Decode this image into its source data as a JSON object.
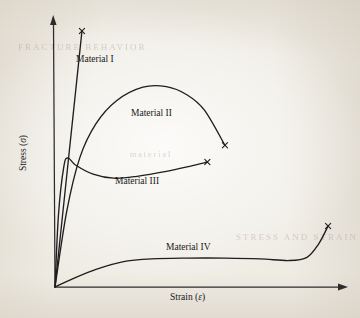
{
  "figure": {
    "background_color": "#efece4",
    "ink_color": "#1e1e1e"
  },
  "chart_data": {
    "type": "line",
    "title": "",
    "xlabel": "Strain (ε)",
    "ylabel": "Stress (σ)",
    "grid": false,
    "legend_position": "inline-annotations",
    "axis_style": "arrow-headed, unlabeled qualitative axes",
    "xlim": [
      0,
      1
    ],
    "ylim": [
      0,
      1
    ],
    "axis_ticks": {
      "x": [],
      "y": []
    },
    "fracture_marker": "x",
    "series": [
      {
        "name": "Material I",
        "label": "Material I",
        "description": "Stiff brittle material: very steep linear elastic response, fractures at high stress with negligible plastic strain.",
        "fracture_point": {
          "x": 0.092,
          "y": 0.948
        },
        "points": [
          {
            "x": 0.0,
            "y": 0.0
          },
          {
            "x": 0.023,
            "y": 0.237
          },
          {
            "x": 0.046,
            "y": 0.474
          },
          {
            "x": 0.069,
            "y": 0.711
          },
          {
            "x": 0.092,
            "y": 0.948
          }
        ]
      },
      {
        "name": "Material II",
        "label": "Material II",
        "description": "Strong ductile material: steep elastic rise, broad work-hardening arch to a high peak stress, then gradual decline to fracture.",
        "fracture_point": {
          "x": 0.58,
          "y": 0.525
        },
        "points": [
          {
            "x": 0.0,
            "y": 0.0
          },
          {
            "x": 0.04,
            "y": 0.28
          },
          {
            "x": 0.085,
            "y": 0.48
          },
          {
            "x": 0.14,
            "y": 0.605
          },
          {
            "x": 0.21,
            "y": 0.69
          },
          {
            "x": 0.3,
            "y": 0.74
          },
          {
            "x": 0.38,
            "y": 0.742
          },
          {
            "x": 0.45,
            "y": 0.712
          },
          {
            "x": 0.51,
            "y": 0.655
          },
          {
            "x": 0.58,
            "y": 0.525
          }
        ]
      },
      {
        "name": "Material III",
        "label": "Material III",
        "description": "Material with a sharp upper yield point followed by a lower yield plateau, then mild strain hardening to fracture.",
        "fracture_point": {
          "x": 0.52,
          "y": 0.463
        },
        "points": [
          {
            "x": 0.0,
            "y": 0.0
          },
          {
            "x": 0.012,
            "y": 0.27
          },
          {
            "x": 0.03,
            "y": 0.445
          },
          {
            "x": 0.044,
            "y": 0.478
          },
          {
            "x": 0.07,
            "y": 0.452
          },
          {
            "x": 0.13,
            "y": 0.418
          },
          {
            "x": 0.2,
            "y": 0.403
          },
          {
            "x": 0.28,
            "y": 0.41
          },
          {
            "x": 0.38,
            "y": 0.428
          },
          {
            "x": 0.46,
            "y": 0.447
          },
          {
            "x": 0.52,
            "y": 0.463
          }
        ]
      },
      {
        "name": "Material IV",
        "label": "Material IV",
        "description": "Soft elastomeric material: low modulus, long low-stress plateau at large strain, then pronounced upturn before fracture.",
        "fracture_point": {
          "x": 0.932,
          "y": 0.226
        },
        "points": [
          {
            "x": 0.0,
            "y": 0.0
          },
          {
            "x": 0.06,
            "y": 0.03
          },
          {
            "x": 0.14,
            "y": 0.065
          },
          {
            "x": 0.23,
            "y": 0.093
          },
          {
            "x": 0.33,
            "y": 0.104
          },
          {
            "x": 0.45,
            "y": 0.107
          },
          {
            "x": 0.58,
            "y": 0.107
          },
          {
            "x": 0.7,
            "y": 0.104
          },
          {
            "x": 0.8,
            "y": 0.098
          },
          {
            "x": 0.86,
            "y": 0.11
          },
          {
            "x": 0.9,
            "y": 0.16
          },
          {
            "x": 0.932,
            "y": 0.226
          }
        ]
      }
    ]
  },
  "annotations": {
    "material_1": "Material I",
    "material_2": "Material II",
    "material_3": "Material III",
    "material_4": "Material IV"
  },
  "axes": {
    "y_label_text": "Stress",
    "y_label_symbol": "σ",
    "x_label_text": "Strain",
    "x_label_symbol": "ε"
  },
  "show_through": {
    "line_1": "FRACTURE BEHAVIOR",
    "line_2": "material",
    "line_3": "STRESS AND STRAIN"
  }
}
